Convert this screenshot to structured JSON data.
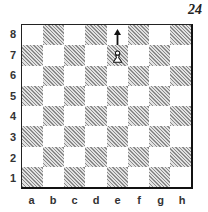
{
  "diagram": {
    "number": "24",
    "ranks": [
      "8",
      "7",
      "6",
      "5",
      "4",
      "3",
      "2",
      "1"
    ],
    "files": [
      "a",
      "b",
      "c",
      "d",
      "e",
      "f",
      "g",
      "h"
    ],
    "pieces": [
      {
        "square": "e7",
        "piece": "white-pawn"
      }
    ],
    "arrows": [
      {
        "from": "e7",
        "to": "e8"
      }
    ]
  }
}
